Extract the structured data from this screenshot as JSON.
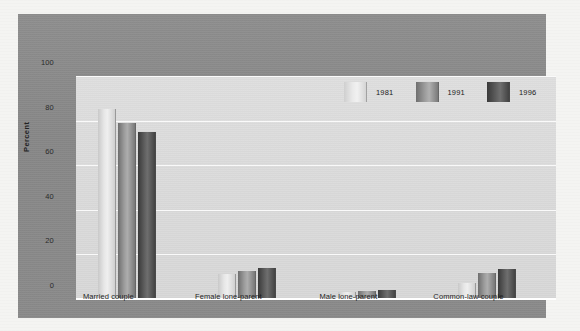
{
  "chart_data": {
    "type": "bar",
    "title": "",
    "xlabel": "",
    "ylabel": "Percent",
    "ylim": [
      0,
      100
    ],
    "yticks": [
      0,
      20,
      40,
      60,
      80,
      100
    ],
    "grid": true,
    "legend_position": "top-right",
    "categories": [
      "Married couple",
      "Female lone-parent",
      "Male lone-parent",
      "Common-law couple"
    ],
    "series": [
      {
        "name": "1981",
        "color": "#e6e6e6",
        "values": [
          85,
          11,
          3,
          7
        ]
      },
      {
        "name": "1991",
        "color": "#9a9a9a",
        "values": [
          79,
          12.5,
          3.5,
          11.5
        ]
      },
      {
        "name": "1996",
        "color": "#5c5c5c",
        "values": [
          75,
          14,
          4,
          13.5
        ]
      }
    ]
  },
  "axes": {
    "y_title": "Percent",
    "y_tick_labels": [
      "100",
      "80",
      "60",
      "40",
      "20",
      "0"
    ]
  },
  "legend": {
    "items": [
      {
        "label": "1981"
      },
      {
        "label": "1991"
      },
      {
        "label": "1996"
      }
    ]
  },
  "colors": {
    "panel": "#8a8a8a",
    "plot_background": "#dadada",
    "gridline": "#ffffff",
    "page": "#f4f4f2"
  }
}
